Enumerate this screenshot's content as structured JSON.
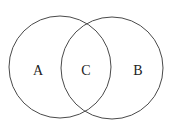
{
  "diagram": {
    "type": "venn",
    "stroke_color": "#4a4a4a",
    "background": "#ffffff",
    "sets": [
      {
        "label": "A",
        "cx": 60,
        "cy": 67,
        "r": 51
      },
      {
        "label": "B",
        "cx": 112,
        "cy": 68,
        "r": 51
      }
    ],
    "intersection": {
      "label": "C"
    },
    "labels": {
      "a": "A",
      "b": "B",
      "c": "C"
    }
  }
}
